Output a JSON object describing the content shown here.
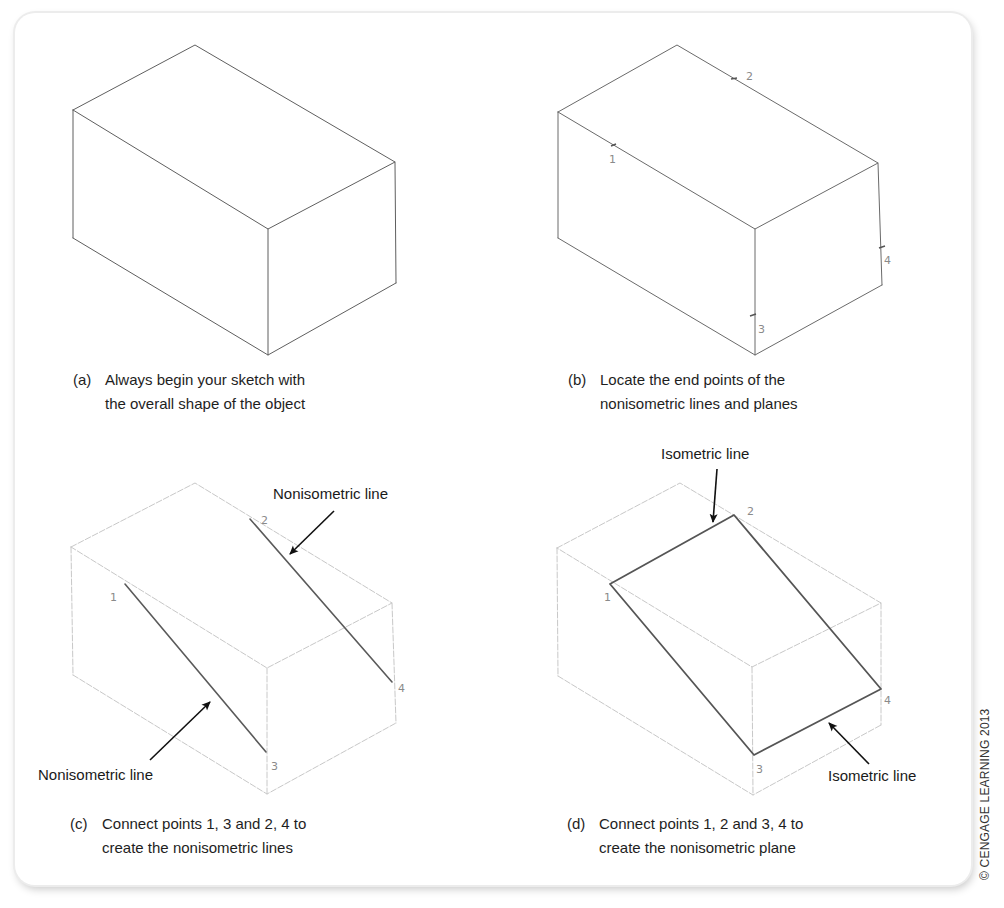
{
  "figure": {
    "copyright": "© CENGAGE LEARNING 2013",
    "colors": {
      "sketch_line": "#5a5a5a",
      "construction_line": "#c8c8c8",
      "bold_line": "#555555",
      "point_label": "#8a8a8a",
      "text": "#1e1e1e",
      "arrow": "#111111"
    },
    "panels": [
      {
        "id": "a",
        "tag": "(a)",
        "caption_line1": "Always begin your sketch with",
        "caption_line2": "the overall shape of the object",
        "points": []
      },
      {
        "id": "b",
        "tag": "(b)",
        "caption_line1": "Locate the end points of the",
        "caption_line2": "nonisometric lines and planes",
        "points": [
          "1",
          "2",
          "3",
          "4"
        ]
      },
      {
        "id": "c",
        "tag": "(c)",
        "caption_line1": "Connect points 1, 3 and 2, 4 to",
        "caption_line2": "create the nonisometric lines",
        "points": [
          "1",
          "2",
          "3",
          "4"
        ],
        "callouts": [
          "Nonisometric line",
          "Nonisometric line"
        ]
      },
      {
        "id": "d",
        "tag": "(d)",
        "caption_line1": "Connect points 1, 2 and 3, 4 to",
        "caption_line2": "create the nonisometric plane",
        "points": [
          "1",
          "2",
          "3",
          "4"
        ],
        "callouts": [
          "Isometric line",
          "Isometric line"
        ]
      }
    ]
  }
}
